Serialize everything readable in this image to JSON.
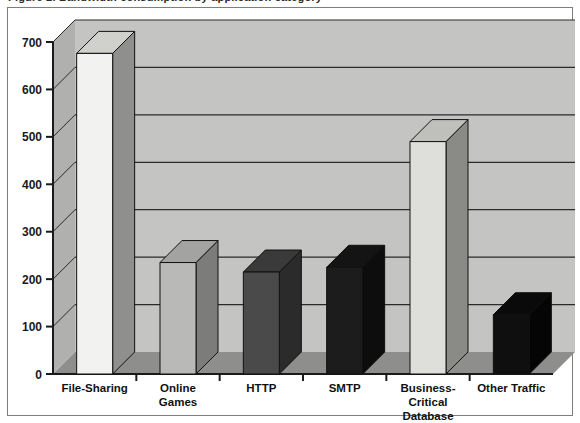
{
  "page": {
    "clipped_header_text": "Figure 2. Bandwidth consumption by application category",
    "background_color": "#ffffff",
    "frame_border_color": "#7d7d7d"
  },
  "chart_data": {
    "type": "bar",
    "title": "",
    "subtitle": "",
    "xlabel": "",
    "ylabel": "",
    "style": "3d-column",
    "grid": true,
    "grid_axis": "y",
    "legend": "none",
    "ylim": [
      0,
      700
    ],
    "yticks": [
      0,
      100,
      200,
      300,
      400,
      500,
      600,
      700
    ],
    "ytick_labels": [
      "0",
      "100",
      "200",
      "300",
      "400",
      "500",
      "600",
      "700"
    ],
    "categories": [
      "File-Sharing",
      "Online Games",
      "HTTP",
      "SMTP",
      "Business-Critical Database",
      "Other Traffic"
    ],
    "category_label_lines": [
      [
        "File-Sharing"
      ],
      [
        "Online",
        "Games"
      ],
      [
        "HTTP"
      ],
      [
        "SMTP"
      ],
      [
        "Business-",
        "Critical",
        "Database"
      ],
      [
        "Other Traffic"
      ]
    ],
    "values": [
      676,
      235,
      215,
      225,
      490,
      125
    ],
    "bar_colors": [
      "#f2f2f0",
      "#b9b9b7",
      "#4a4a4a",
      "#1c1c1c",
      "#dededa",
      "#0f0f0f"
    ],
    "bar_side_colors": [
      "#8f8f8d",
      "#7c7c7a",
      "#2b2b2b",
      "#0d0d0d",
      "#8a8a87",
      "#050505"
    ],
    "bar_top_colors": [
      "#d0d0cd",
      "#a3a3a1",
      "#3a3a3a",
      "#141414",
      "#bfbfbc",
      "#0a0a0a"
    ],
    "plot_wall_color": "#c4c4c2",
    "plot_floor_color": "#8e8e8c",
    "plot_side_wall_color": "#b0b0ae",
    "gridline_color": "#2a2a2a",
    "axis_color": "#1a1a1a"
  }
}
